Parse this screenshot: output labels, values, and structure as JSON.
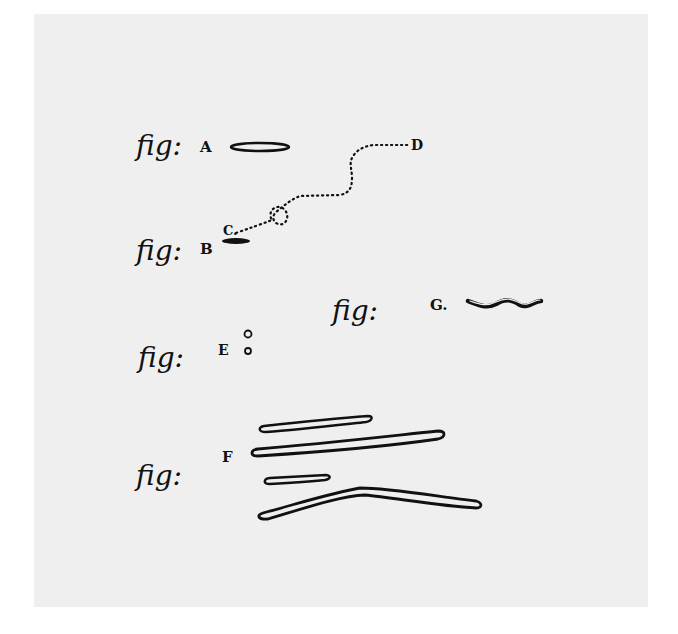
{
  "plate": {
    "background": "#efefef",
    "ink": "#111111"
  },
  "figures": [
    {
      "id": "A",
      "prefix": "fig:",
      "letter": "A",
      "shape": "oval-rod"
    },
    {
      "id": "B",
      "prefix": "fig:",
      "letter": "B",
      "shape": "small-oval",
      "path_start_label": "C",
      "path_end_label": "D"
    },
    {
      "id": "E",
      "prefix": "fig:",
      "letter": "E",
      "shape": "two-cocci"
    },
    {
      "id": "F",
      "prefix": "fig:",
      "letter": "F",
      "shape": "long-rods"
    },
    {
      "id": "G",
      "prefix": "fig:",
      "letter": "G.",
      "shape": "spiral"
    }
  ],
  "path_labels": {
    "start": "C.",
    "end": "D"
  }
}
